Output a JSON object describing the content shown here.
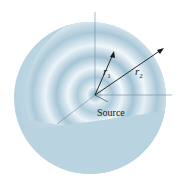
{
  "figure": {
    "labels": {
      "r1": "r",
      "r1_sub": "1",
      "r2": "r",
      "r2_sub": "2",
      "source": "Source"
    },
    "colors": {
      "sphere_base": "#b9d3e0",
      "sphere_dark": "#8fb4c8",
      "cutaway_light": "#e8f1f6",
      "ring_dark": "#7fa6bd",
      "line": "#1a1a1a",
      "edge_line": "#6f8fa3"
    }
  }
}
